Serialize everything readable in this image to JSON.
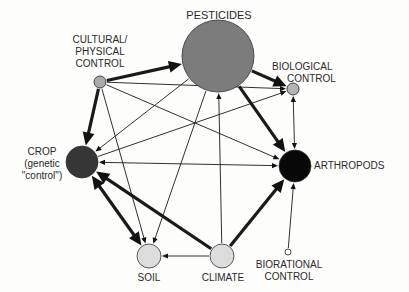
{
  "diagram": {
    "nodes": [
      {
        "id": "pesticides",
        "label_lines": [
          "PESTICIDES"
        ],
        "cx": 218,
        "cy": 56,
        "r": 36,
        "fill": "#7c7c7c"
      },
      {
        "id": "cultural",
        "label_lines": [
          "CULTURAL/",
          "PHYSICAL",
          "CONTROL"
        ],
        "cx": 100,
        "cy": 82,
        "r": 6,
        "fill": "#a9a9a9"
      },
      {
        "id": "biological",
        "label_lines": [
          "BIOLOGICAL",
          "CONTROL"
        ],
        "cx": 293,
        "cy": 89,
        "r": 6,
        "fill": "#b4b4b4"
      },
      {
        "id": "crop",
        "label_lines": [
          "CROP",
          "(genetic",
          "\"control\")"
        ],
        "cx": 82,
        "cy": 162,
        "r": 16,
        "fill": "#363636"
      },
      {
        "id": "arthropods",
        "label_lines": [
          "ARTHROPODS"
        ],
        "cx": 295,
        "cy": 166,
        "r": 16,
        "fill": "#080808"
      },
      {
        "id": "soil",
        "label_lines": [
          "SOIL"
        ],
        "cx": 149,
        "cy": 256,
        "r": 12,
        "fill": "#dcdcdc"
      },
      {
        "id": "climate",
        "label_lines": [
          "CLIMATE"
        ],
        "cx": 222,
        "cy": 256,
        "r": 12,
        "fill": "#dcdcdc"
      },
      {
        "id": "biorational",
        "label_lines": [
          "BIORATIONAL",
          "CONTROL"
        ],
        "cx": 288,
        "cy": 252,
        "r": 3,
        "fill": "#ffffff"
      }
    ],
    "edges": [
      {
        "from": "cultural",
        "to": "pesticides",
        "weight": "thick"
      },
      {
        "from": "cultural",
        "to": "crop",
        "weight": "thick"
      },
      {
        "from": "cultural",
        "to": "biological",
        "weight": "thin"
      },
      {
        "from": "cultural",
        "to": "arthropods",
        "weight": "thin"
      },
      {
        "from": "cultural",
        "to": "soil",
        "weight": "thin"
      },
      {
        "from": "pesticides",
        "to": "biological",
        "weight": "thick"
      },
      {
        "from": "pesticides",
        "to": "arthropods",
        "weight": "thick"
      },
      {
        "from": "pesticides",
        "to": "soil",
        "weight": "thin"
      },
      {
        "from": "pesticides",
        "to": "crop",
        "weight": "thin"
      },
      {
        "from": "climate",
        "to": "pesticides",
        "weight": "thin"
      },
      {
        "from": "arthropods",
        "to": "crop",
        "weight": "thin",
        "bidirectional": true
      },
      {
        "from": "crop",
        "to": "biological",
        "weight": "thin"
      },
      {
        "from": "biological",
        "to": "arthropods",
        "weight": "thin",
        "bidirectional": true
      },
      {
        "from": "crop",
        "to": "soil",
        "weight": "thick",
        "bidirectional": true
      },
      {
        "from": "climate",
        "to": "crop",
        "weight": "thick"
      },
      {
        "from": "climate",
        "to": "arthropods",
        "weight": "thick"
      },
      {
        "from": "climate",
        "to": "soil",
        "weight": "thin"
      },
      {
        "from": "biorational",
        "to": "arthropods",
        "weight": "thin"
      }
    ]
  },
  "labels": {
    "pesticides": "PESTICIDES",
    "cultural_1": "CULTURAL/",
    "cultural_2": "PHYSICAL",
    "cultural_3": "CONTROL",
    "biological_1": "BIOLOGICAL",
    "biological_2": "CONTROL",
    "crop_1": "CROP",
    "crop_2": "(genetic",
    "crop_3": "\"control\")",
    "arthropods": "ARTHROPODS",
    "soil": "SOIL",
    "climate": "CLIMATE",
    "biorational_1": "BIORATIONAL",
    "biorational_2": "CONTROL"
  }
}
